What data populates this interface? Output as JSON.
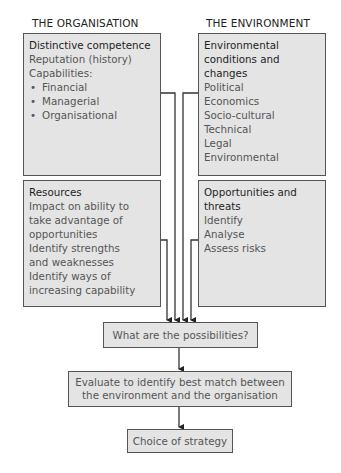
{
  "columns": {
    "organisation": {
      "title": "THE ORGANISATION",
      "top_panel": {
        "heading": "Distinctive competence",
        "lines": [
          "Reputation (history)",
          "Capabilities:"
        ],
        "bullets": [
          "Financial",
          "Managerial",
          "Organisational"
        ]
      },
      "bottom_panel": {
        "heading": "Resources",
        "lines": [
          "Impact on ability to",
          "take advantage of",
          "opportunities",
          "Identify strengths",
          "and weaknesses",
          "Identify ways of",
          "increasing capability"
        ]
      }
    },
    "environment": {
      "title": "THE ENVIRONMENT",
      "top_panel": {
        "heading_lines": [
          "Environmental",
          "conditions and",
          "changes"
        ],
        "lines": [
          "Political",
          "Economics",
          "Socio-cultural",
          "Technical",
          "Legal",
          "Environmental"
        ]
      },
      "bottom_panel": {
        "heading_lines": [
          "Opportunities and",
          "threats"
        ],
        "lines": [
          "Identify",
          "Analyse",
          "Assess risks"
        ]
      }
    }
  },
  "flow": {
    "possibilities": "What are the possibilities?",
    "evaluate_lines": [
      "Evaluate to identify best match between",
      "the environment and the organisation"
    ],
    "choice": "Choice of strategy"
  },
  "colors": {
    "box_fill": "#e4e4e4",
    "border": "#555555",
    "heading_text": "#1e1e1e",
    "body_text": "#555555"
  }
}
